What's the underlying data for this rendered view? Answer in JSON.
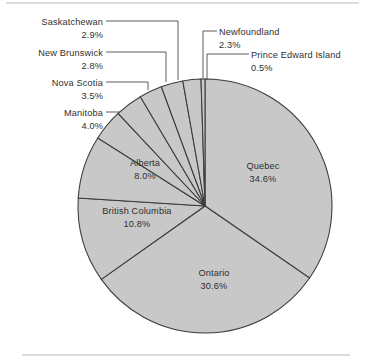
{
  "figure": {
    "background_color": "#ffffff",
    "slice_fill_color": "#c8c8c8",
    "slice_stroke_color": "#3b3b3b",
    "leader_line_color": "#4a4a4a",
    "text_color": "#2f2f2f",
    "rule_color": "#b9b9b9"
  },
  "chart_data": {
    "type": "pie",
    "title": "",
    "subtitle": "",
    "xlabel": "",
    "ylabel": "",
    "grid": false,
    "legend": "none",
    "labels_position": "callout-and-inside",
    "start_angle_deg": 0,
    "direction": "clockwise",
    "value_unit": "percent",
    "categories": [
      "Quebec",
      "Ontario",
      "British Columbia",
      "Alberta",
      "Manitoba",
      "Nova Scotia",
      "Saskatchewan",
      "New Brunswick",
      "Newfoundland",
      "Prince Edward Island"
    ],
    "values": [
      34.6,
      30.6,
      10.8,
      8.0,
      4.0,
      3.5,
      2.9,
      2.8,
      2.3,
      0.5
    ],
    "slices": [
      {
        "name": "Quebec",
        "value": 34.6,
        "value_text": "34.6%",
        "label_placement": "inside"
      },
      {
        "name": "Ontario",
        "value": 30.6,
        "value_text": "30.6%",
        "label_placement": "inside"
      },
      {
        "name": "British Columbia",
        "value": 10.8,
        "value_text": "10.8%",
        "label_placement": "inside"
      },
      {
        "name": "Alberta",
        "value": 8.0,
        "value_text": "8.0%",
        "label_placement": "inside"
      },
      {
        "name": "Manitoba",
        "value": 4.0,
        "value_text": "4.0%",
        "label_placement": "callout-left"
      },
      {
        "name": "Nova Scotia",
        "value": 3.5,
        "value_text": "3.5%",
        "label_placement": "callout-left"
      },
      {
        "name": "New Brunswick",
        "value": 2.8,
        "value_text": "2.8%",
        "label_placement": "callout-left"
      },
      {
        "name": "Saskatchewan",
        "value": 2.9,
        "value_text": "2.9%",
        "label_placement": "callout-left"
      },
      {
        "name": "Newfoundland",
        "value": 2.3,
        "value_text": "2.3%",
        "label_placement": "callout-right"
      },
      {
        "name": "Prince Edward Island",
        "value": 0.5,
        "value_text": "0.5%",
        "label_placement": "callout-right"
      }
    ]
  },
  "labels": {
    "saskatchewan": {
      "name": "Saskatchewan",
      "value": "2.9%"
    },
    "new_brunswick": {
      "name": "New Brunswick",
      "value": "2.8%"
    },
    "nova_scotia": {
      "name": "Nova Scotia",
      "value": "3.5%"
    },
    "manitoba": {
      "name": "Manitoba",
      "value": "4.0%"
    },
    "alberta": {
      "name": "Alberta",
      "value": "8.0%"
    },
    "british_columbia": {
      "name": "British Columbia",
      "value": "10.8%"
    },
    "ontario": {
      "name": "Ontario",
      "value": "30.6%"
    },
    "quebec": {
      "name": "Quebec",
      "value": "34.6%"
    },
    "newfoundland": {
      "name": "Newfoundland",
      "value": "2.3%"
    },
    "pei": {
      "name": "Prince Edward Island",
      "value": "0.5%"
    }
  }
}
